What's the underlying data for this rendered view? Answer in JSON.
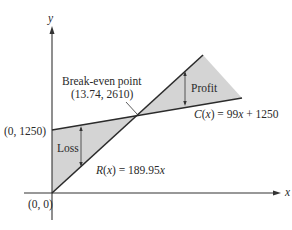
{
  "diagram": {
    "type": "break-even graph",
    "axes": {
      "x_label": "x",
      "y_label": "y"
    },
    "labels": {
      "break_even_title": "Break-even point",
      "break_even_coords": "(13.74, 2610)",
      "y_intercept": "(0, 1250)",
      "origin": "(0, 0)",
      "profit": "Profit",
      "loss": "Loss",
      "cost_func_name": "C",
      "cost_func_var": "x",
      "cost_func_rest": " = 99",
      "cost_func_x": "x",
      "cost_func_tail": " + 1250",
      "revenue_func_name": "R",
      "revenue_func_var": "x",
      "revenue_func_rest": " = 189.95",
      "revenue_func_x": "x"
    },
    "functions": {
      "cost": "C(x) = 99x + 1250",
      "revenue": "R(x) = 189.95x"
    },
    "break_even_point": {
      "x": 13.74,
      "y": 2610
    },
    "colors": {
      "line": "#2b2b2b",
      "shade": "#d4d4d4",
      "axis": "#333333"
    }
  }
}
